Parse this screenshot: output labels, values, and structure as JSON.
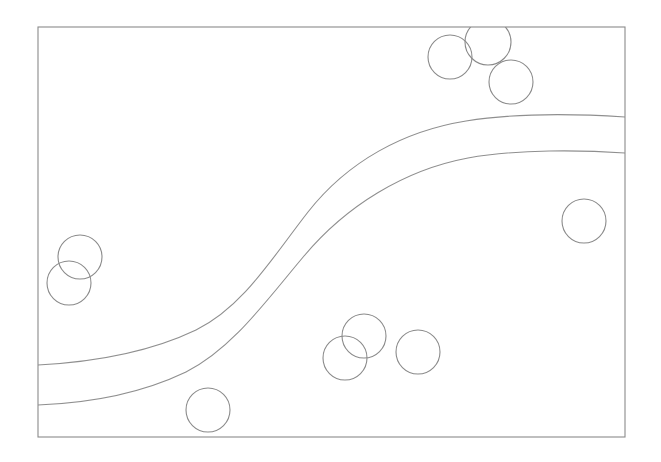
{
  "figure": {
    "title": "",
    "background_color": "#ffffff",
    "width": 661,
    "height": 462,
    "frame": {
      "name": "plot-frame",
      "x": 38,
      "y": 27,
      "width": 587,
      "height": 410,
      "stroke_color": "#8a8a8a",
      "stroke_width": 1.1,
      "fill": "none"
    },
    "curves": {
      "stroke_color": "#8f8f8f",
      "stroke_width": 1.1,
      "count": 2,
      "shape": "sigmoid-band",
      "items": [
        {
          "name": "upper-band-curve",
          "label": "upper boundary",
          "path": "M 38,365 C 96,362 150,352 196,330 C 243,307 272,258 308,212 C 348,161 404,131 466,121 C 516,113 580,114 625,117",
          "start_point": [
            38,
            365
          ],
          "end_point": [
            625,
            117
          ]
        },
        {
          "name": "lower-band-curve",
          "label": "lower boundary",
          "path": "M 38,405 C 92,403 142,393 186,372 C 232,349 266,301 304,256 C 346,206 404,170 468,158 C 518,149 582,150 625,153",
          "start_point": [
            38,
            405
          ],
          "end_point": [
            625,
            153
          ]
        }
      ]
    },
    "markers": {
      "name": "circle-markers",
      "stroke_color": "#8a8a8a",
      "stroke_width": 1.1,
      "fill": "none",
      "radius": 22,
      "count": 10,
      "items": [
        {
          "id": "c1",
          "group": "top-cluster",
          "cx": 450,
          "cy": 57,
          "r": 22
        },
        {
          "id": "c2",
          "group": "top-cluster",
          "cx": 488,
          "cy": 42,
          "r": 23
        },
        {
          "id": "c3",
          "group": "top-cluster",
          "cx": 511,
          "cy": 82,
          "r": 22
        },
        {
          "id": "c4",
          "group": "right-solo",
          "cx": 584,
          "cy": 221,
          "r": 22
        },
        {
          "id": "c5",
          "group": "left-pair",
          "cx": 80,
          "cy": 257,
          "r": 22
        },
        {
          "id": "c6",
          "group": "left-pair",
          "cx": 69,
          "cy": 283,
          "r": 22
        },
        {
          "id": "c7",
          "group": "bottom-cluster",
          "cx": 364,
          "cy": 336,
          "r": 22
        },
        {
          "id": "c8",
          "group": "bottom-cluster",
          "cx": 418,
          "cy": 352,
          "r": 22
        },
        {
          "id": "c9",
          "group": "bottom-cluster",
          "cx": 345,
          "cy": 358,
          "r": 22
        },
        {
          "id": "c10",
          "group": "bottom-solo",
          "cx": 208,
          "cy": 410,
          "r": 22
        }
      ]
    }
  },
  "chart_data": {
    "type": "scatter",
    "title": "",
    "subtitle": "",
    "xlabel": "",
    "ylabel": "",
    "xlim": [
      38,
      625
    ],
    "ylim": [
      27,
      437
    ],
    "grid": false,
    "legend": null,
    "axis_ticks": {
      "x": [],
      "y": []
    },
    "annotations": [],
    "series": [
      {
        "name": "markers",
        "type": "scatter",
        "marker": "open-circle",
        "marker_radius_px": 22,
        "color": "#8a8a8a",
        "points": [
          [
            450,
            57
          ],
          [
            488,
            42
          ],
          [
            511,
            82
          ],
          [
            584,
            221
          ],
          [
            80,
            257
          ],
          [
            69,
            283
          ],
          [
            364,
            336
          ],
          [
            418,
            352
          ],
          [
            345,
            358
          ],
          [
            208,
            410
          ]
        ]
      },
      {
        "name": "upper boundary",
        "type": "line",
        "color": "#8f8f8f",
        "points": [
          [
            38,
            365
          ],
          [
            90,
            363
          ],
          [
            140,
            355
          ],
          [
            190,
            333
          ],
          [
            240,
            296
          ],
          [
            290,
            238
          ],
          [
            340,
            178
          ],
          [
            390,
            144
          ],
          [
            440,
            126
          ],
          [
            490,
            119
          ],
          [
            540,
            116
          ],
          [
            590,
            116
          ],
          [
            625,
            117
          ]
        ]
      },
      {
        "name": "lower boundary",
        "type": "line",
        "color": "#8f8f8f",
        "points": [
          [
            38,
            405
          ],
          [
            90,
            403
          ],
          [
            140,
            395
          ],
          [
            186,
            373
          ],
          [
            236,
            338
          ],
          [
            286,
            280
          ],
          [
            336,
            218
          ],
          [
            386,
            182
          ],
          [
            436,
            164
          ],
          [
            486,
            156
          ],
          [
            536,
            152
          ],
          [
            586,
            152
          ],
          [
            625,
            153
          ]
        ]
      }
    ]
  }
}
